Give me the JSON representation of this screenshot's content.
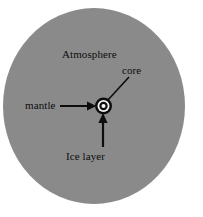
{
  "figure": {
    "type": "cross-section-diagram",
    "background_color": "#ffffff",
    "body": {
      "name": "planet-disk",
      "shape": "ellipse",
      "fill_color": "#8a8a8a",
      "center_x": 94,
      "center_y": 106,
      "radius_x": 91,
      "radius_y": 98
    },
    "core_assembly": {
      "center_x": 103.5,
      "center_y": 106,
      "rings": [
        {
          "name": "outer-dark-ring",
          "radius": 8.5,
          "fill_color": "#0d0d0d"
        },
        {
          "name": "white-ring",
          "radius": 6.0,
          "fill_color": "#f2f2f2"
        },
        {
          "name": "inner-dark-ring",
          "radius": 4.2,
          "fill_color": "#0d0d0d"
        },
        {
          "name": "core-dot",
          "radius": 2.0,
          "fill_color": "#f7f7f7"
        }
      ]
    },
    "line_color": "#0d0d0d"
  },
  "labels": {
    "atmosphere": "Atmosphere",
    "core": "core",
    "mantle": "mantle",
    "ice_layer": "Ice layer"
  },
  "leaders": {
    "core": {
      "name": "core-leader-line",
      "x1": 129,
      "y1": 77,
      "x2": 107,
      "y2": 101,
      "has_arrowhead": false
    },
    "mantle": {
      "name": "mantle-arrow",
      "x1": 60,
      "y1": 106,
      "x2": 95,
      "y2": 106,
      "has_arrowhead": true
    },
    "ice_layer": {
      "name": "ice-layer-arrow",
      "x1": 103,
      "y1": 147,
      "x2": 103,
      "y2": 116,
      "has_arrowhead": true
    }
  }
}
